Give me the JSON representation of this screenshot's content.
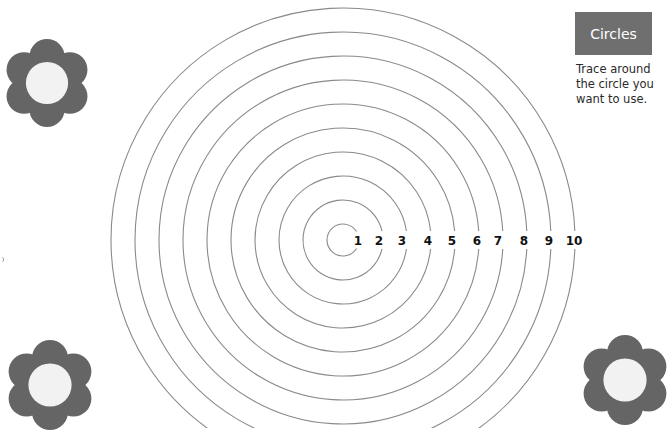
{
  "header": {
    "title": "Circles",
    "instruction_lines": [
      "Trace around",
      "the circle you",
      "want to use."
    ]
  },
  "target": {
    "center": [
      343,
      240
    ],
    "circle_labels": [
      "1",
      "2",
      "3",
      "4",
      "5",
      "6",
      "7",
      "8",
      "9",
      "10"
    ],
    "label_x": [
      358,
      379,
      402,
      428,
      452,
      477,
      498,
      524,
      549,
      574
    ],
    "radii": [
      16,
      40,
      64,
      88,
      112,
      136,
      160,
      184,
      208,
      232
    ],
    "stroke_color": "#8a8a8a"
  },
  "decorations": {
    "flowers": [
      {
        "name": "flower-top-left",
        "cx": 47,
        "cy": 83,
        "size": 88
      },
      {
        "name": "flower-bottom-left",
        "cx": 50,
        "cy": 385,
        "size": 90
      },
      {
        "name": "flower-bottom-right",
        "cx": 625,
        "cy": 380,
        "size": 90
      }
    ],
    "petal_color": "#656565",
    "center_color": "#f2f2f2"
  }
}
